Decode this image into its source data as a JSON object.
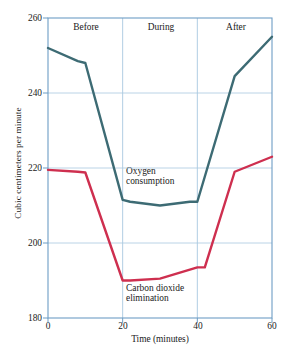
{
  "chart_data": {
    "type": "line",
    "title": "",
    "xlabel": "Time (minutes)",
    "ylabel": "Cubic centimeters per minute",
    "xlim": [
      0,
      60
    ],
    "ylim": [
      180,
      260
    ],
    "xticks": [
      0,
      20,
      40,
      60
    ],
    "yticks": [
      180,
      200,
      220,
      240,
      260
    ],
    "grid": true,
    "grid_color": "#a8c8e0",
    "frame_color": "#6d9dc5",
    "legend": "inline-annotations",
    "annotations": [
      {
        "name": "phase-before",
        "text": "Before",
        "x": 10,
        "y": 256
      },
      {
        "name": "phase-during",
        "text": "During",
        "x": 30,
        "y": 256
      },
      {
        "name": "phase-after",
        "text": "After",
        "x": 50,
        "y": 256
      },
      {
        "name": "oxygen-label",
        "text_line1": "Oxygen",
        "text_line2": "consumption",
        "x": 24,
        "y": 216
      },
      {
        "name": "carbon-label",
        "text_line1": "Carbon dioxide",
        "text_line2": "elimination",
        "x": 24,
        "y": 188
      }
    ],
    "dividers": [
      20,
      40
    ],
    "series": [
      {
        "name": "Oxygen consumption",
        "color": "#3d6b74",
        "x": [
          0,
          8,
          10,
          20,
          22,
          30,
          38,
          40,
          50,
          60
        ],
        "values": [
          252,
          248.5,
          248,
          211.5,
          211,
          210,
          211,
          211,
          244.5,
          255
        ]
      },
      {
        "name": "Carbon dioxide elimination",
        "color": "#ce2f4f",
        "x": [
          0,
          8,
          10,
          20,
          22,
          30,
          40,
          42,
          50,
          60
        ],
        "values": [
          219.5,
          219,
          218.8,
          190,
          190,
          190.5,
          193.5,
          193.5,
          219,
          223
        ]
      }
    ]
  },
  "axis": {
    "y_tick_labels": [
      "260",
      "240",
      "220",
      "200",
      "180"
    ],
    "x_tick_labels": [
      "0",
      "20",
      "40",
      "60"
    ],
    "y_title": "Cubic centimeters per minute",
    "x_title": "Time (minutes)"
  },
  "phases": {
    "before": "Before",
    "during": "During",
    "after": "After"
  },
  "labels": {
    "oxygen_line1": "Oxygen",
    "oxygen_line2": "consumption",
    "carbon_line1": "Carbon dioxide",
    "carbon_line2": "elimination"
  }
}
